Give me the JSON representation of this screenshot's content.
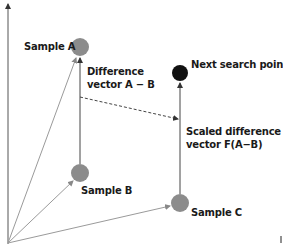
{
  "diagram": {
    "colors": {
      "sample": "#8c8c8c",
      "next_point": "#111111",
      "axis": "#555555",
      "origin_vector": "#9a9a9a",
      "difference_vector": "#444444",
      "text": "#1a1a1a"
    },
    "points": [
      {
        "id": "sample-a",
        "label": "Sample A"
      },
      {
        "id": "sample-b",
        "label": "Sample B"
      },
      {
        "id": "sample-c",
        "label": "Sample C"
      },
      {
        "id": "next",
        "label": "Next search point"
      }
    ],
    "annotations": {
      "difference_line1": "Difference",
      "difference_line2": "vector A − B",
      "scaled_line1": "Scaled difference",
      "scaled_line2": "vector F(A−B)"
    }
  }
}
